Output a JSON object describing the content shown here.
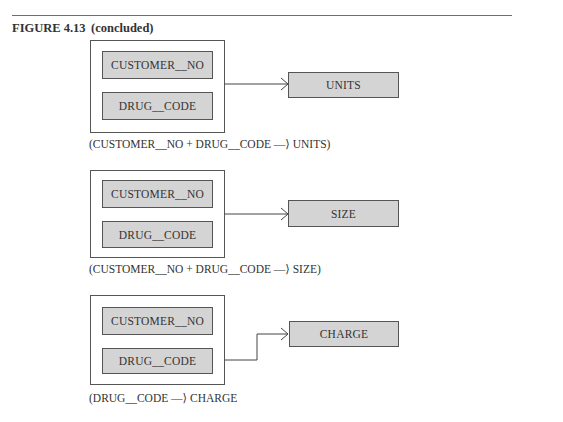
{
  "figure": {
    "label": "FIGURE 4.13",
    "subtitle": "(concluded)"
  },
  "diagrams": [
    {
      "determinants": [
        "CUSTOMER__NO",
        "DRUG__CODE"
      ],
      "dependent": "UNITS",
      "caption": "(CUSTOMER__NO + DRUG__CODE —⟩ UNITS)"
    },
    {
      "determinants": [
        "CUSTOMER__NO",
        "DRUG__CODE"
      ],
      "dependent": "SIZE",
      "caption": "(CUSTOMER__NO + DRUG__CODE —⟩ SIZE)"
    },
    {
      "determinants": [
        "CUSTOMER__NO",
        "DRUG__CODE"
      ],
      "dependent": "CHARGE",
      "caption": "(DRUG__CODE —⟩ CHARGE"
    }
  ],
  "colors": {
    "attribute_fill": "#d4d4d4",
    "border": "#555555",
    "rule": "#6e6e6e"
  }
}
